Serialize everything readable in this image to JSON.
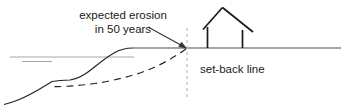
{
  "diagram": {
    "labels": {
      "erosion_line_1": "expected erosion",
      "erosion_line_2": "in 50 years",
      "setback": "set-back line"
    },
    "colors": {
      "ink": "#1a1a1a",
      "ground_line": "#555555",
      "water_line": "#9a9a9a",
      "setback_line": "#bdbdbd"
    },
    "elements": {
      "house": "house-outline",
      "ground": "ground-line",
      "water": "water-surface-lines",
      "current_profile": "current-cliff-profile",
      "eroded_profile": "expected-eroded-profile-dashed",
      "setback": "set-back-vertical-dotted-line",
      "pointer": "annotation-arrow"
    }
  }
}
